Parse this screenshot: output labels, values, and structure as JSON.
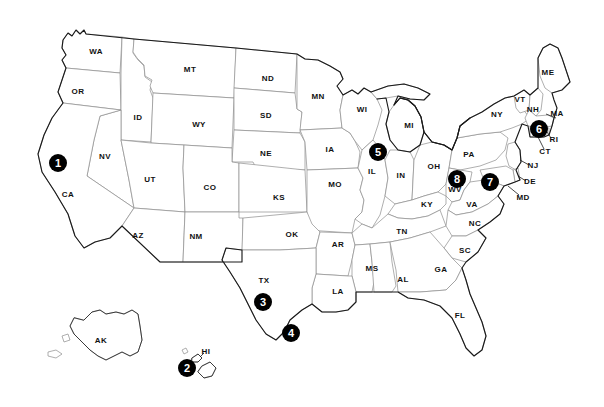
{
  "map": {
    "title": "United States Map with Numbered Location Markers",
    "type": "choropleth-outline",
    "projection": "albers-usa",
    "width": 604,
    "height": 407,
    "background_color": "#ffffff",
    "state_fill_color": "#ffffff",
    "state_border_color": "#8d8d8d",
    "outer_border_color": "#1a1a1a",
    "label_color": "#111111",
    "marker_fill_color": "#000000",
    "marker_text_color": "#ffffff"
  },
  "state_labels": [
    {
      "code": "WA",
      "x": 96,
      "y": 52
    },
    {
      "code": "OR",
      "x": 78,
      "y": 92
    },
    {
      "code": "ID",
      "x": 138,
      "y": 118
    },
    {
      "code": "MT",
      "x": 190,
      "y": 70
    },
    {
      "code": "WY",
      "x": 199,
      "y": 125
    },
    {
      "code": "ND",
      "x": 268,
      "y": 79
    },
    {
      "code": "SD",
      "x": 266,
      "y": 116
    },
    {
      "code": "NE",
      "x": 266,
      "y": 154
    },
    {
      "code": "MN",
      "x": 318,
      "y": 97
    },
    {
      "code": "IA",
      "x": 330,
      "y": 150
    },
    {
      "code": "WI",
      "x": 362,
      "y": 110
    },
    {
      "code": "MI",
      "x": 409,
      "y": 126
    },
    {
      "code": "NV",
      "x": 105,
      "y": 157
    },
    {
      "code": "UT",
      "x": 150,
      "y": 180
    },
    {
      "code": "CA",
      "x": 68,
      "y": 195
    },
    {
      "code": "CO",
      "x": 210,
      "y": 188
    },
    {
      "code": "KS",
      "x": 279,
      "y": 198
    },
    {
      "code": "MO",
      "x": 335,
      "y": 185
    },
    {
      "code": "IL",
      "x": 372,
      "y": 172
    },
    {
      "code": "IN",
      "x": 401,
      "y": 176
    },
    {
      "code": "OH",
      "x": 434,
      "y": 167
    },
    {
      "code": "PA",
      "x": 469,
      "y": 155
    },
    {
      "code": "NY",
      "x": 497,
      "y": 115
    },
    {
      "code": "ME",
      "x": 548,
      "y": 73
    },
    {
      "code": "VT",
      "x": 520,
      "y": 100
    },
    {
      "code": "NH",
      "x": 533,
      "y": 110
    },
    {
      "code": "MA",
      "x": 557,
      "y": 114
    },
    {
      "code": "RI",
      "x": 554,
      "y": 140
    },
    {
      "code": "CT",
      "x": 545,
      "y": 152
    },
    {
      "code": "NJ",
      "x": 533,
      "y": 166
    },
    {
      "code": "DE",
      "x": 530,
      "y": 182
    },
    {
      "code": "MD",
      "x": 523,
      "y": 198
    },
    {
      "code": "WV",
      "x": 455,
      "y": 190
    },
    {
      "code": "VA",
      "x": 472,
      "y": 205
    },
    {
      "code": "KY",
      "x": 427,
      "y": 205
    },
    {
      "code": "AZ",
      "x": 138,
      "y": 236
    },
    {
      "code": "NM",
      "x": 196,
      "y": 237
    },
    {
      "code": "OK",
      "x": 292,
      "y": 235
    },
    {
      "code": "AR",
      "x": 338,
      "y": 245
    },
    {
      "code": "TN",
      "x": 402,
      "y": 232
    },
    {
      "code": "NC",
      "x": 475,
      "y": 224
    },
    {
      "code": "SC",
      "x": 465,
      "y": 251
    },
    {
      "code": "MS",
      "x": 372,
      "y": 269
    },
    {
      "code": "AL",
      "x": 403,
      "y": 280
    },
    {
      "code": "GA",
      "x": 441,
      "y": 270
    },
    {
      "code": "LA",
      "x": 338,
      "y": 292
    },
    {
      "code": "TX",
      "x": 264,
      "y": 281
    },
    {
      "code": "FL",
      "x": 460,
      "y": 316
    },
    {
      "code": "AK",
      "x": 101,
      "y": 341
    },
    {
      "code": "HI",
      "x": 206,
      "y": 352
    }
  ],
  "markers": [
    {
      "number": "1",
      "x": 58,
      "y": 163,
      "state": "CA"
    },
    {
      "number": "2",
      "x": 187,
      "y": 368,
      "state": "HI"
    },
    {
      "number": "3",
      "x": 263,
      "y": 302,
      "state": "TX"
    },
    {
      "number": "4",
      "x": 291,
      "y": 333,
      "state": "TX"
    },
    {
      "number": "5",
      "x": 378,
      "y": 152,
      "state": "IL"
    },
    {
      "number": "6",
      "x": 539,
      "y": 129,
      "state": "MA"
    },
    {
      "number": "7",
      "x": 490,
      "y": 182,
      "state": "VA"
    },
    {
      "number": "8",
      "x": 457,
      "y": 179,
      "state": "WV"
    }
  ]
}
